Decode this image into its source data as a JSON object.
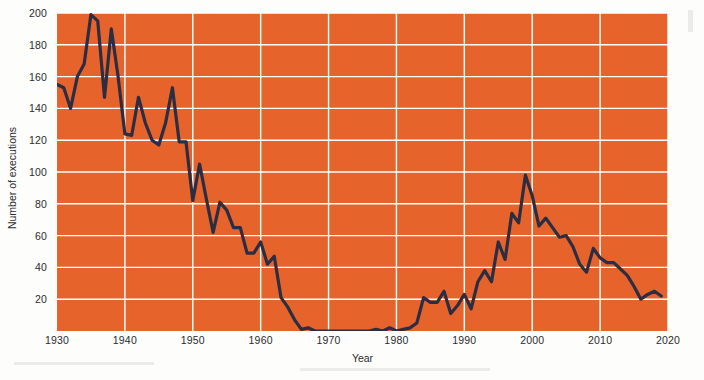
{
  "chart_data": {
    "type": "line",
    "title": "",
    "subtitle": "",
    "xlabel": "Year",
    "ylabel": "Number of executions",
    "xlim": [
      1930,
      2020
    ],
    "ylim": [
      0,
      200
    ],
    "grid": true,
    "legend": null,
    "x_ticks": [
      1930,
      1940,
      1950,
      1960,
      1970,
      1980,
      1990,
      2000,
      2010,
      2020
    ],
    "y_ticks": [
      20,
      40,
      60,
      80,
      100,
      120,
      140,
      160,
      180,
      200
    ],
    "colors": {
      "plot_background": "#e6632c",
      "gridline": "#ffffff",
      "line": "#2b2d42",
      "figure_background": "#fdfdfc",
      "axis_text": "#2c2c2c"
    },
    "series": [
      {
        "name": "Number of executions",
        "color": "#2b2d42",
        "x": [
          1930,
          1931,
          1932,
          1933,
          1934,
          1935,
          1936,
          1937,
          1938,
          1939,
          1940,
          1941,
          1942,
          1943,
          1944,
          1945,
          1946,
          1947,
          1948,
          1949,
          1950,
          1951,
          1952,
          1953,
          1954,
          1955,
          1956,
          1957,
          1958,
          1959,
          1960,
          1961,
          1962,
          1963,
          1964,
          1965,
          1966,
          1967,
          1968,
          1969,
          1970,
          1971,
          1972,
          1973,
          1974,
          1975,
          1976,
          1977,
          1978,
          1979,
          1980,
          1981,
          1982,
          1983,
          1984,
          1985,
          1986,
          1987,
          1988,
          1989,
          1990,
          1991,
          1992,
          1993,
          1994,
          1995,
          1996,
          1997,
          1998,
          1999,
          2000,
          2001,
          2002,
          2003,
          2004,
          2005,
          2006,
          2007,
          2008,
          2009,
          2010,
          2011,
          2012,
          2013,
          2014,
          2015,
          2016,
          2017,
          2018,
          2019
        ],
        "values": [
          155,
          153,
          140,
          160,
          168,
          199,
          195,
          147,
          190,
          160,
          124,
          123,
          147,
          131,
          120,
          117,
          131,
          153,
          119,
          119,
          82,
          105,
          83,
          62,
          81,
          76,
          65,
          65,
          49,
          49,
          56,
          42,
          47,
          21,
          15,
          7,
          1,
          2,
          0,
          0,
          0,
          0,
          0,
          0,
          0,
          0,
          0,
          1,
          0,
          2,
          0,
          1,
          2,
          5,
          21,
          18,
          18,
          25,
          11,
          16,
          23,
          14,
          31,
          38,
          31,
          56,
          45,
          74,
          68,
          98,
          85,
          66,
          71,
          65,
          59,
          60,
          53,
          42,
          37,
          52,
          46,
          43,
          43,
          39,
          35,
          28,
          20,
          23,
          25,
          22
        ]
      }
    ]
  },
  "axes": {
    "y_title": "Number of executions",
    "x_title": "Year",
    "y_tick_labels": [
      "200",
      "180",
      "160",
      "140",
      "120",
      "100",
      "80",
      "60",
      "40",
      "20"
    ],
    "x_tick_labels": [
      "1930",
      "1940",
      "1950",
      "1960",
      "1970",
      "1980",
      "1990",
      "2000",
      "2010",
      "2020"
    ]
  }
}
